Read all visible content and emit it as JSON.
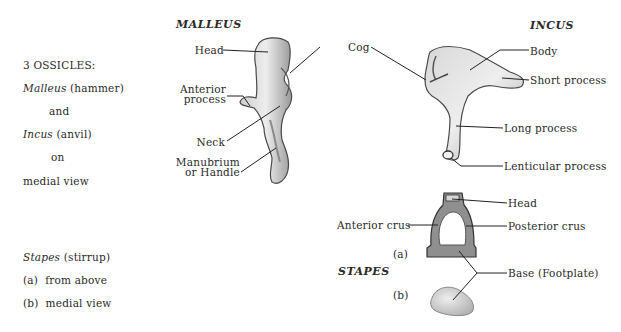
{
  "sidebar": {
    "heading": "3 OSSICLES:",
    "malleus_name": "Malleus",
    "malleus_common": "(hammer)",
    "and": "and",
    "incus_name": "Incus",
    "incus_common": "(anvil)",
    "on": "on",
    "view": "medial view",
    "stapes_name": "Stapes",
    "stapes_common": "(stirrup)",
    "view_a": "(a)  from above",
    "view_b": "(b)  medial view"
  },
  "malleus": {
    "title": "MALLEUS",
    "labels": {
      "head": "Head",
      "anterior_process_1": "Anterior",
      "anterior_process_2": "process",
      "neck": "Neck",
      "manubrium_1": "Manubrium",
      "manubrium_2": "or Handle"
    }
  },
  "shared": {
    "cog": "Cog"
  },
  "incus": {
    "title": "INCUS",
    "labels": {
      "body": "Body",
      "short_process": "Short process",
      "long_process": "Long process",
      "lenticular_process": "Lenticular process"
    }
  },
  "stapes": {
    "title": "STAPES",
    "view_a": "(a)",
    "view_b": "(b)",
    "labels": {
      "head": "Head",
      "anterior_crus": "Anterior crus",
      "posterior_crus": "Posterior crus",
      "base": "Base (Footplate)"
    }
  },
  "colors": {
    "bone_light": "#e4e4e4",
    "bone_mid": "#b8b8b8",
    "bone_dark": "#5a5a5a",
    "line": "#222222"
  }
}
